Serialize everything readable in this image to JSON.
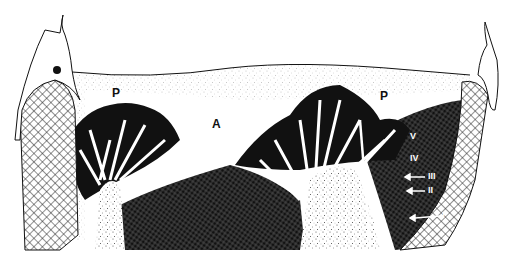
{
  "figure": {
    "type": "scientific line drawing (cross-section)",
    "background": "#ffffff",
    "ink": "#111111",
    "labels": {
      "p_left": "P",
      "a_center": "A",
      "p_right": "P",
      "v": "V",
      "iv": "IV",
      "iii": "III",
      "ii": "II",
      "i": "I"
    },
    "regions": [
      {
        "name": "left-pillar",
        "pattern": "crosshatch-light"
      },
      {
        "name": "left-head",
        "pattern": "outline-with-dot"
      },
      {
        "name": "upper-zone",
        "pattern": "stipple"
      },
      {
        "name": "left-branching-cluster",
        "pattern": "black-lobes"
      },
      {
        "name": "central-dark-mass",
        "pattern": "dense-crosshatch"
      },
      {
        "name": "right-branching-cluster",
        "pattern": "black-lobes"
      },
      {
        "name": "right-trunk",
        "pattern": "stipple"
      },
      {
        "name": "right-pillar",
        "pattern": "crosshatch-light"
      },
      {
        "name": "right-head",
        "pattern": "outline"
      }
    ]
  }
}
